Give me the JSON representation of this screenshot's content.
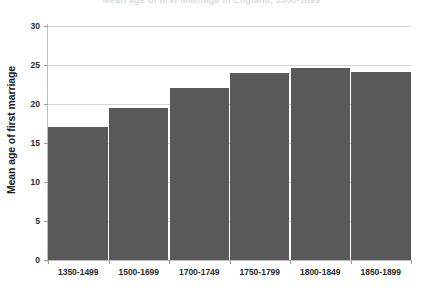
{
  "chart_data": {
    "type": "bar",
    "title": "Mean age of first marriage in England, 1350-1899",
    "xlabel": "",
    "ylabel": "Mean age of first marriage",
    "categories": [
      "1350-1499",
      "1500-1699",
      "1700-1749",
      "1750-1799",
      "1800-1849",
      "1850-1899"
    ],
    "values": [
      17.0,
      19.5,
      22.0,
      24.0,
      24.6,
      24.1
    ],
    "ylim": [
      0,
      30
    ],
    "yticks": [
      0,
      5,
      10,
      15,
      20,
      25,
      30
    ],
    "ytick_labels": [
      "0",
      "5",
      "10",
      "15",
      "20",
      "25",
      "30"
    ],
    "grid": true,
    "legend": false,
    "bar_color": "#595959",
    "gridline_color": "#d4d4d4",
    "axis_color": "#bdbdbd",
    "text_color": "#2b2b2b"
  }
}
